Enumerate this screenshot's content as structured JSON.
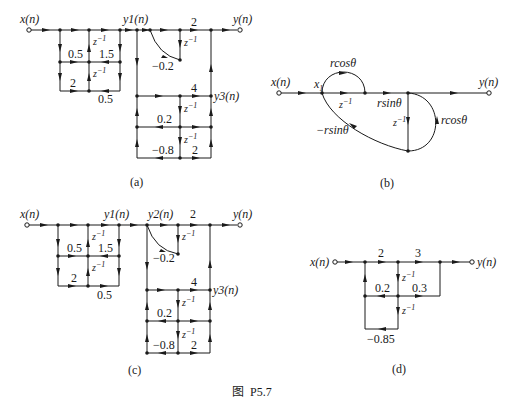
{
  "figure": {
    "caption": "图  P5.7",
    "top_text_clipped": "",
    "panels": [
      {
        "id": "a",
        "label": "(a)",
        "input": "x(n)",
        "output": "y(n)",
        "nodes": {
          "y1": "y1(n)",
          "y3": "y3(n)"
        },
        "gains": {
          "g_05_left": "0.5",
          "g_15": "1.5",
          "g_2_bottom": "2",
          "g_05_bottom": "0.5",
          "g_2_top": "2",
          "g_neg02": "−0.2",
          "g_4": "4",
          "g_02": "0.2",
          "g_neg08": "−0.8",
          "g_2_lower": "2"
        },
        "delay": "z",
        "delay_exp": "−1"
      },
      {
        "id": "b",
        "label": "(b)",
        "input": "x(n)",
        "output": "y(n)",
        "node_x1": "x",
        "node_x1_sub": "1",
        "gains": {
          "rcos_top": "rcosθ",
          "rsin": "rsinθ",
          "neg_rsin": "−rsinθ",
          "rcos_right": "rcosθ"
        },
        "delay": "z",
        "delay_exp": "−1"
      },
      {
        "id": "c",
        "label": "(c)",
        "input": "x(n)",
        "output": "y(n)",
        "nodes": {
          "y1": "y1(n)",
          "y2": "y2(n)",
          "y3": "y3(n)"
        },
        "gains": {
          "g_05_left": "0.5",
          "g_15": "1.5",
          "g_2_bottom": "2",
          "g_05_bottom": "0.5",
          "g_2_top": "2",
          "g_neg02": "−0.2",
          "g_4": "4",
          "g_02": "0.2",
          "g_neg08": "−0.8",
          "g_2_lower": "2"
        },
        "delay": "z",
        "delay_exp": "−1"
      },
      {
        "id": "d",
        "label": "(d)",
        "input": "x(n)",
        "output": "y(n)",
        "gains": {
          "g_2": "2",
          "g_3": "3",
          "g_02": "0.2",
          "g_03": "0.3",
          "g_neg085": "−0.85"
        },
        "delay": "z",
        "delay_exp": "−1"
      }
    ]
  }
}
